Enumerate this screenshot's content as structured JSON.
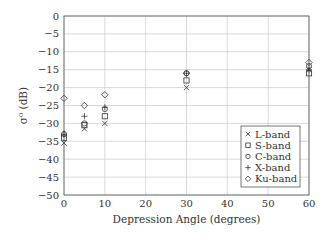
{
  "chart_data": {
    "type": "scatter",
    "title": "",
    "xlabel": "Depression Angle (degrees)",
    "ylabel": "σ⁰ (dB)",
    "xlim": [
      0,
      60
    ],
    "ylim": [
      -50,
      0
    ],
    "xticks": [
      0,
      10,
      20,
      30,
      40,
      50,
      60
    ],
    "yticks": [
      0,
      -5,
      -10,
      -15,
      -20,
      -25,
      -30,
      -35,
      -40,
      -45,
      -50
    ],
    "grid": true,
    "legend_position": "lower right",
    "series": [
      {
        "name": "L-band",
        "marker": "x",
        "points": [
          [
            0,
            -35.5
          ],
          [
            5,
            -31.5
          ],
          [
            10,
            -30
          ],
          [
            30,
            -20
          ],
          [
            60,
            -15
          ]
        ]
      },
      {
        "name": "S-band",
        "marker": "square",
        "points": [
          [
            0,
            -34
          ],
          [
            5,
            -30.5
          ],
          [
            10,
            -28
          ],
          [
            30,
            -18
          ],
          [
            60,
            -16
          ]
        ]
      },
      {
        "name": "C-band",
        "marker": "circle",
        "points": [
          [
            0,
            -33
          ],
          [
            5,
            -30
          ],
          [
            10,
            -26
          ],
          [
            30,
            -16
          ],
          [
            60,
            -14
          ]
        ]
      },
      {
        "name": "X-band",
        "marker": "plus",
        "points": [
          [
            0,
            -33
          ],
          [
            5,
            -28
          ],
          [
            10,
            -25.5
          ],
          [
            30,
            -16
          ],
          [
            60,
            -15
          ]
        ]
      },
      {
        "name": "Ku-band",
        "marker": "diamond",
        "points": [
          [
            0,
            -23
          ],
          [
            5,
            -25
          ],
          [
            10,
            -22
          ],
          [
            30,
            -16
          ],
          [
            60,
            -13
          ]
        ]
      }
    ]
  }
}
